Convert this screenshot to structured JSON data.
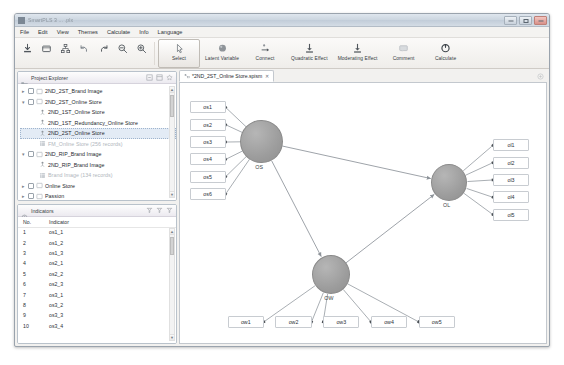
{
  "window": {
    "title": "SmartPLS 3 ... .plx",
    "minimize_label": "Minimize",
    "maximize_label": "Maximize",
    "close_label": "Close"
  },
  "menu": {
    "items": [
      {
        "label": "File"
      },
      {
        "label": "Edit"
      },
      {
        "label": "View"
      },
      {
        "label": "Themes"
      },
      {
        "label": "Calculate"
      },
      {
        "label": "Info"
      },
      {
        "label": "Language"
      }
    ]
  },
  "toolbar": {
    "icon_buttons": [
      {
        "name": "import-data-icon",
        "tooltip": "Import"
      },
      {
        "name": "new-project-icon",
        "tooltip": "New Project"
      },
      {
        "name": "hierarchy-icon",
        "tooltip": "Hierarchy"
      },
      {
        "name": "undo-icon",
        "tooltip": "Undo"
      },
      {
        "name": "redo-icon",
        "tooltip": "Redo"
      },
      {
        "name": "zoom-out-icon",
        "tooltip": "Zoom Out"
      },
      {
        "name": "zoom-in-icon",
        "tooltip": "Zoom In"
      }
    ],
    "buttons": [
      {
        "label": "Select",
        "icon": "cursor-icon",
        "active": true
      },
      {
        "label": "Latent Variable",
        "icon": "latent-variable-icon",
        "active": false
      },
      {
        "label": "Connect",
        "icon": "connect-icon",
        "active": false
      },
      {
        "label": "Quadratic Effect",
        "icon": "quadratic-effect-icon",
        "active": false
      },
      {
        "label": "Moderating Effect",
        "icon": "moderating-effect-icon",
        "active": false
      },
      {
        "label": "Comment",
        "icon": "comment-icon",
        "active": false
      },
      {
        "label": "Calculate",
        "icon": "calculate-icon",
        "active": false
      }
    ]
  },
  "project_explorer": {
    "title": "Project Explorer",
    "icon": "folder-icon",
    "tools": [
      {
        "name": "collapse-all-icon"
      },
      {
        "name": "layout-icon"
      },
      {
        "name": "favorite-icon"
      }
    ],
    "nodes": [
      {
        "label": "2ND_2ST_Brand Image",
        "level": 1,
        "type": "project",
        "twisty": "collapsed",
        "checkbox": true,
        "dim": false,
        "selected": false
      },
      {
        "label": "2ND_2ST_Online Store",
        "level": 1,
        "type": "project",
        "twisty": "expanded",
        "checkbox": true,
        "dim": false,
        "selected": false
      },
      {
        "label": "2ND_1ST_Online Store",
        "level": 2,
        "type": "model",
        "twisty": "none",
        "checkbox": false,
        "dim": false,
        "selected": false
      },
      {
        "label": "2ND_1ST_Redundancy_Online Store",
        "level": 2,
        "type": "model",
        "twisty": "none",
        "checkbox": false,
        "dim": false,
        "selected": false
      },
      {
        "label": "2ND_2ST_Online Store",
        "level": 2,
        "type": "model",
        "twisty": "none",
        "checkbox": false,
        "dim": false,
        "selected": true
      },
      {
        "label": "FM_Online Store (256 records)",
        "level": 2,
        "type": "data",
        "twisty": "none",
        "checkbox": false,
        "dim": true,
        "selected": false
      },
      {
        "label": "2ND_RIP_Brand Image",
        "level": 1,
        "type": "project",
        "twisty": "expanded",
        "checkbox": true,
        "dim": false,
        "selected": false
      },
      {
        "label": "2ND_RIP_Brand Image",
        "level": 2,
        "type": "model",
        "twisty": "none",
        "checkbox": false,
        "dim": false,
        "selected": false
      },
      {
        "label": "Brand Image (134 records)",
        "level": 2,
        "type": "data",
        "twisty": "none",
        "checkbox": false,
        "dim": true,
        "selected": false
      },
      {
        "label": "Online Store",
        "level": 1,
        "type": "project",
        "twisty": "collapsed",
        "checkbox": true,
        "dim": false,
        "selected": false
      },
      {
        "label": "Passion",
        "level": 1,
        "type": "project",
        "twisty": "collapsed",
        "checkbox": true,
        "dim": false,
        "selected": false
      },
      {
        "label": "PLS_Book",
        "level": 1,
        "type": "project",
        "twisty": "collapsed",
        "checkbox": true,
        "dim": false,
        "selected": false
      },
      {
        "label": "Sponsor Brand",
        "level": 1,
        "type": "project",
        "twisty": "collapsed",
        "checkbox": true,
        "dim": false,
        "selected": false
      },
      {
        "label": "平衡 二手整新 Passion",
        "level": 1,
        "type": "project",
        "twisty": "collapsed",
        "checkbox": true,
        "dim": false,
        "selected": false
      }
    ]
  },
  "indicators_panel": {
    "title": "Indicators",
    "icon": "indicators-icon",
    "tools": [
      {
        "name": "filter-icon"
      },
      {
        "name": "filter-clear-icon"
      },
      {
        "name": "filter-settings-icon"
      }
    ],
    "columns": [
      "No.",
      "Indicator"
    ],
    "rows": [
      {
        "no": "1",
        "indicator": "os1_1"
      },
      {
        "no": "2",
        "indicator": "os1_2"
      },
      {
        "no": "3",
        "indicator": "os1_3"
      },
      {
        "no": "4",
        "indicator": "os2_1"
      },
      {
        "no": "5",
        "indicator": "os2_2"
      },
      {
        "no": "6",
        "indicator": "os2_3"
      },
      {
        "no": "7",
        "indicator": "os3_1"
      },
      {
        "no": "8",
        "indicator": "os3_2"
      },
      {
        "no": "9",
        "indicator": "os3_3"
      },
      {
        "no": "10",
        "indicator": "os3_4"
      }
    ]
  },
  "editor": {
    "tab": {
      "label": "*2ND_2ST_Online Store.spism",
      "icon": "model-icon",
      "close_label": "✕",
      "modified": true
    },
    "strip_tool": "maximize-editor-icon"
  },
  "diagram": {
    "latents": [
      {
        "id": "OS",
        "label": "OS",
        "cx": 77,
        "cy": 54,
        "r": 20
      },
      {
        "id": "OL",
        "label": "OL",
        "cx": 254,
        "cy": 92,
        "r": 17
      },
      {
        "id": "OW",
        "label": "OW",
        "cx": 142,
        "cy": 177,
        "r": 18
      }
    ],
    "indicator_boxes": [
      {
        "label": "os1",
        "x": 9,
        "y": 17,
        "w": 34,
        "h": 11,
        "attached_to": "OS"
      },
      {
        "label": "os2",
        "x": 9,
        "y": 33,
        "w": 34,
        "h": 11,
        "attached_to": "OS"
      },
      {
        "label": "os3",
        "x": 9,
        "y": 49,
        "w": 34,
        "h": 11,
        "attached_to": "OS"
      },
      {
        "label": "os4",
        "x": 9,
        "y": 65,
        "w": 34,
        "h": 11,
        "attached_to": "OS"
      },
      {
        "label": "os5",
        "x": 9,
        "y": 81,
        "w": 34,
        "h": 11,
        "attached_to": "OS"
      },
      {
        "label": "os6",
        "x": 9,
        "y": 97,
        "w": 34,
        "h": 11,
        "attached_to": "OS"
      },
      {
        "label": "ol1",
        "x": 295,
        "y": 52,
        "w": 34,
        "h": 11,
        "attached_to": "OL"
      },
      {
        "label": "ol2",
        "x": 295,
        "y": 68,
        "w": 34,
        "h": 11,
        "attached_to": "OL"
      },
      {
        "label": "ol3",
        "x": 295,
        "y": 84,
        "w": 34,
        "h": 11,
        "attached_to": "OL"
      },
      {
        "label": "ol4",
        "x": 295,
        "y": 100,
        "w": 34,
        "h": 11,
        "attached_to": "OL"
      },
      {
        "label": "ol5",
        "x": 295,
        "y": 116,
        "w": 34,
        "h": 11,
        "attached_to": "OL"
      },
      {
        "label": "ow1",
        "x": 45,
        "y": 215,
        "w": 34,
        "h": 11,
        "attached_to": "OW"
      },
      {
        "label": "ow2",
        "x": 90,
        "y": 215,
        "w": 34,
        "h": 11,
        "attached_to": "OW"
      },
      {
        "label": "ow3",
        "x": 135,
        "y": 215,
        "w": 34,
        "h": 11,
        "attached_to": "OW"
      },
      {
        "label": "ow4",
        "x": 180,
        "y": 215,
        "w": 34,
        "h": 11,
        "attached_to": "OW"
      },
      {
        "label": "ow5",
        "x": 225,
        "y": 215,
        "w": 34,
        "h": 11,
        "attached_to": "OW"
      }
    ],
    "structural_paths": [
      {
        "from": "OS",
        "to": "OL"
      },
      {
        "from": "OS",
        "to": "OW"
      },
      {
        "from": "OW",
        "to": "OL"
      }
    ]
  },
  "colors": {
    "latent_fill": "#9d9d9d",
    "box_border": "#c8ccd1",
    "arrow": "#9aa0a6",
    "selection": "#e3ebf5"
  }
}
